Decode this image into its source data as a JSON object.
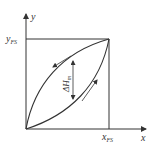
{
  "diagram": {
    "type": "hysteresis-curve",
    "axes": {
      "x_label": "x",
      "y_label": "y",
      "x_fs_label": "x",
      "x_fs_sub": "FS",
      "y_fs_label": "y",
      "y_fs_sub": "FS"
    },
    "annotation": {
      "delta_label": "ΔH",
      "delta_sub": "m"
    },
    "curves": [
      {
        "name": "loading-curve",
        "direction": "increasing"
      },
      {
        "name": "unloading-curve",
        "direction": "decreasing"
      }
    ],
    "colors": {
      "line": "#333333",
      "text": "#333333",
      "background": "#ffffff"
    }
  }
}
